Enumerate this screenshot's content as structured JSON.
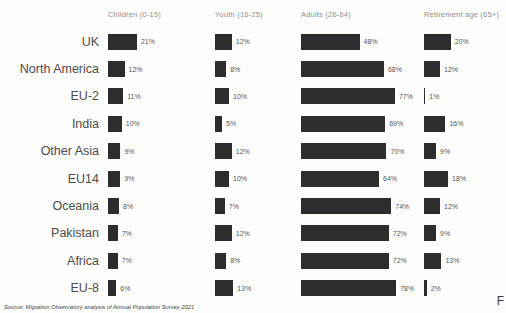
{
  "chart_data": {
    "type": "bar",
    "orientation": "horizontal",
    "title": "",
    "bar_color": "#2d2d2d",
    "value_suffix": "%",
    "categories": [
      "UK",
      "North America",
      "EU-2",
      "India",
      "Other Asia",
      "EU14",
      "Oceania",
      "Pakistan",
      "Africa",
      "EU-8"
    ],
    "series": [
      {
        "name": "Children (0-15)",
        "values": [
          21,
          12,
          11,
          10,
          9,
          9,
          8,
          7,
          7,
          6
        ]
      },
      {
        "name": "Youth (16-25)",
        "values": [
          12,
          8,
          10,
          5,
          12,
          10,
          7,
          12,
          8,
          13
        ]
      },
      {
        "name": "Adults (26-64)",
        "values": [
          48,
          68,
          77,
          69,
          70,
          64,
          74,
          72,
          72,
          78
        ]
      },
      {
        "name": "Retirement age (65+)",
        "values": [
          20,
          12,
          1,
          16,
          9,
          18,
          12,
          9,
          13,
          2
        ]
      }
    ],
    "layout_hint": "small multiples: one column of horizontal bars per series, value label after each bar",
    "xlim": [
      0,
      100
    ],
    "grid": false,
    "legend_position": "column headers (top)"
  },
  "footer": {
    "source": "Source:  Migration Observatory analysis of Annual Population Survey 2021",
    "page_marker": "F"
  }
}
